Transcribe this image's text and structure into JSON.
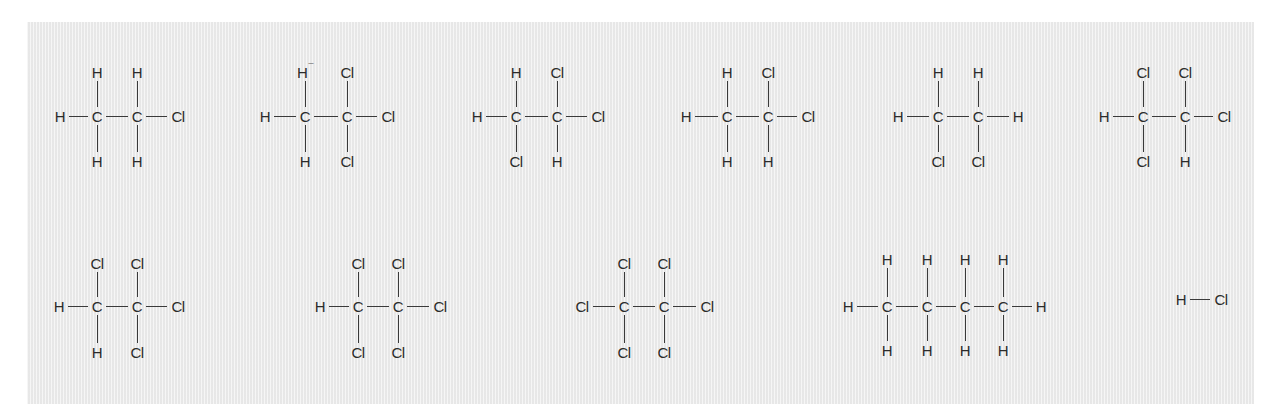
{
  "figure": {
    "title": "",
    "colors": {
      "panel_background": "#ececec",
      "ink": "#2b2b2b",
      "page_background": "#ffffff"
    }
  },
  "molecules": [
    {
      "id": "m1",
      "name": "chloroethane",
      "row": 1,
      "center_y": 116,
      "top_y": 72,
      "bottom_y": 161,
      "left": {
        "label": "H",
        "x": 60
      },
      "carbons": [
        {
          "x": 97,
          "top": "H",
          "bottom": "H"
        },
        {
          "x": 137,
          "top": "H",
          "bottom": "H"
        }
      ],
      "right": {
        "label": "Cl",
        "x": 178
      }
    },
    {
      "id": "m2",
      "name": "1,1,1-trichloroethane",
      "row": 1,
      "center_y": 116,
      "top_y": 72,
      "bottom_y": 161,
      "left": {
        "label": "H",
        "x": 265
      },
      "carbons": [
        {
          "x": 305,
          "top": "H",
          "top_mark": "¯",
          "bottom": "H"
        },
        {
          "x": 347,
          "top": "Cl",
          "bottom": "Cl"
        }
      ],
      "right": {
        "label": "Cl",
        "x": 388
      }
    },
    {
      "id": "m3",
      "name": "1,1,2-trichloroethane",
      "row": 1,
      "center_y": 116,
      "top_y": 72,
      "bottom_y": 161,
      "left": {
        "label": "H",
        "x": 477
      },
      "carbons": [
        {
          "x": 516,
          "top": "H",
          "bottom": "Cl"
        },
        {
          "x": 557,
          "top": "Cl",
          "bottom": "H"
        }
      ],
      "right": {
        "label": "Cl",
        "x": 598
      }
    },
    {
      "id": "m4",
      "name": "1,1-dichloroethane",
      "row": 1,
      "center_y": 116,
      "top_y": 72,
      "bottom_y": 161,
      "left": {
        "label": "H",
        "x": 686
      },
      "carbons": [
        {
          "x": 727,
          "top": "H",
          "bottom": "H"
        },
        {
          "x": 768,
          "top": "Cl",
          "bottom": "H"
        }
      ],
      "right": {
        "label": "Cl",
        "x": 808
      }
    },
    {
      "id": "m5",
      "name": "1,2-dichloroethane",
      "row": 1,
      "center_y": 116,
      "top_y": 72,
      "bottom_y": 161,
      "left": {
        "label": "H",
        "x": 898
      },
      "carbons": [
        {
          "x": 938,
          "top": "H",
          "bottom": "Cl"
        },
        {
          "x": 978,
          "top": "H",
          "bottom": "Cl"
        }
      ],
      "right": {
        "label": "H",
        "x": 1018
      }
    },
    {
      "id": "m6",
      "name": "1,1,2,2-tetrachloroethane",
      "row": 1,
      "center_y": 116,
      "top_y": 72,
      "bottom_y": 161,
      "left": {
        "label": "H",
        "x": 1104
      },
      "carbons": [
        {
          "x": 1143,
          "top": "Cl",
          "bottom": "Cl"
        },
        {
          "x": 1185,
          "top": "Cl",
          "bottom": "H"
        }
      ],
      "right": {
        "label": "Cl",
        "x": 1224
      }
    },
    {
      "id": "m7",
      "name": "1,1,1,2-tetrachloroethane",
      "row": 2,
      "center_y": 306,
      "top_y": 263,
      "bottom_y": 352,
      "left": {
        "label": "H",
        "x": 59
      },
      "carbons": [
        {
          "x": 97,
          "top": "Cl",
          "bottom": "H"
        },
        {
          "x": 137,
          "top": "Cl",
          "bottom": "Cl"
        }
      ],
      "right": {
        "label": "Cl",
        "x": 178
      }
    },
    {
      "id": "m8",
      "name": "pentachloroethane",
      "row": 2,
      "center_y": 306,
      "top_y": 263,
      "bottom_y": 352,
      "left": {
        "label": "H",
        "x": 320
      },
      "carbons": [
        {
          "x": 358,
          "top": "Cl",
          "bottom": "Cl"
        },
        {
          "x": 398,
          "top": "Cl",
          "bottom": "Cl"
        }
      ],
      "right": {
        "label": "Cl",
        "x": 440
      }
    },
    {
      "id": "m9",
      "name": "hexachloroethane",
      "row": 2,
      "center_y": 306,
      "top_y": 263,
      "bottom_y": 352,
      "left": {
        "label": "Cl",
        "x": 582
      },
      "carbons": [
        {
          "x": 624,
          "top": "Cl",
          "bottom": "Cl"
        },
        {
          "x": 664,
          "top": "Cl",
          "bottom": "Cl"
        }
      ],
      "right": {
        "label": "Cl",
        "x": 707
      }
    },
    {
      "id": "m10",
      "name": "butane",
      "row": 2,
      "center_y": 306,
      "top_y": 259,
      "bottom_y": 350,
      "left": {
        "label": "H",
        "x": 848
      },
      "carbons": [
        {
          "x": 887,
          "top": "H",
          "bottom": "H"
        },
        {
          "x": 927,
          "top": "H",
          "bottom": "H"
        },
        {
          "x": 965,
          "top": "H",
          "bottom": "H"
        },
        {
          "x": 1003,
          "top": "H",
          "bottom": "H"
        }
      ],
      "right": {
        "label": "H",
        "x": 1041
      }
    },
    {
      "id": "m11",
      "name": "hydrogen chloride",
      "row": 2,
      "center_y": 299,
      "top_y": null,
      "bottom_y": null,
      "left": {
        "label": "H",
        "x": 1181
      },
      "carbons": [],
      "right": {
        "label": "Cl",
        "x": 1221
      }
    }
  ],
  "carbon_label": "C"
}
